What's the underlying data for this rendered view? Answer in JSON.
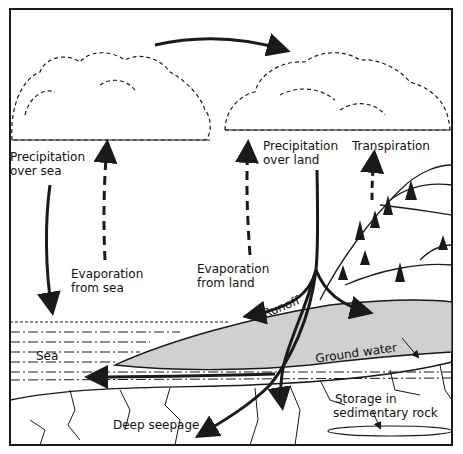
{
  "diagram": {
    "labels": {
      "precip_sea_1": "Precipitation",
      "precip_sea_2": "over sea",
      "evap_sea_1": "Evaporation",
      "evap_sea_2": "from sea",
      "evap_land_1": "Evaporation",
      "evap_land_2": "from land",
      "precip_land_1": "Precipitation",
      "precip_land_2": "over land",
      "transpiration": "Transpiration",
      "runoff": "Runoff",
      "sea": "Sea",
      "ground_water": "Ground water",
      "storage_1": "Storage in",
      "storage_2": "sedimentary rock",
      "deep_seepage": "Deep seepage"
    },
    "colors": {
      "ink": "#1a1a1a",
      "groundwater_fill": "#d0d0d0",
      "background": "#ffffff"
    }
  }
}
